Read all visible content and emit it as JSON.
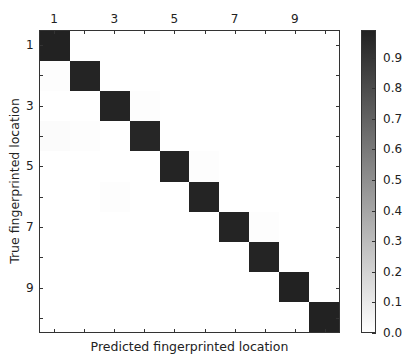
{
  "chart_data": {
    "type": "heatmap",
    "title": "",
    "xlabel": "Predicted fingerprinted location",
    "ylabel": "True fingerprinted location",
    "x_categories": [
      "1",
      "2",
      "3",
      "4",
      "5",
      "6",
      "7",
      "8",
      "9",
      "10"
    ],
    "y_categories": [
      "1",
      "2",
      "3",
      "4",
      "5",
      "6",
      "7",
      "8",
      "9",
      "10"
    ],
    "x_tick_labels": [
      "1",
      "3",
      "5",
      "7",
      "9"
    ],
    "y_tick_labels": [
      "1",
      "3",
      "5",
      "7",
      "9"
    ],
    "x_axis_position": "top",
    "colormap": "Greys",
    "colorbar": {
      "vmin": 0.0,
      "vmax": 0.99,
      "ticks": [
        "0.0",
        "0.1",
        "0.2",
        "0.3",
        "0.4",
        "0.5",
        "0.6",
        "0.7",
        "0.8",
        "0.9"
      ]
    },
    "values": [
      [
        0.99,
        0.0,
        0.0,
        0.0,
        0.0,
        0.0,
        0.0,
        0.0,
        0.0,
        0.0
      ],
      [
        0.01,
        0.98,
        0.0,
        0.0,
        0.0,
        0.0,
        0.0,
        0.0,
        0.0,
        0.0
      ],
      [
        0.0,
        0.0,
        0.98,
        0.01,
        0.0,
        0.0,
        0.0,
        0.0,
        0.0,
        0.0
      ],
      [
        0.02,
        0.01,
        0.0,
        0.97,
        0.0,
        0.0,
        0.0,
        0.0,
        0.0,
        0.0
      ],
      [
        0.0,
        0.0,
        0.0,
        0.0,
        0.98,
        0.01,
        0.0,
        0.0,
        0.0,
        0.0
      ],
      [
        0.0,
        0.0,
        0.01,
        0.0,
        0.0,
        0.98,
        0.0,
        0.0,
        0.0,
        0.0
      ],
      [
        0.0,
        0.0,
        0.0,
        0.0,
        0.0,
        0.0,
        0.98,
        0.01,
        0.0,
        0.0
      ],
      [
        0.0,
        0.0,
        0.0,
        0.0,
        0.0,
        0.0,
        0.0,
        0.98,
        0.0,
        0.0
      ],
      [
        0.0,
        0.0,
        0.0,
        0.0,
        0.0,
        0.0,
        0.0,
        0.0,
        0.99,
        0.0
      ],
      [
        0.0,
        0.0,
        0.0,
        0.0,
        0.0,
        0.0,
        0.0,
        0.0,
        0.0,
        0.99
      ]
    ],
    "grid": false,
    "legend": "colorbar-right"
  }
}
